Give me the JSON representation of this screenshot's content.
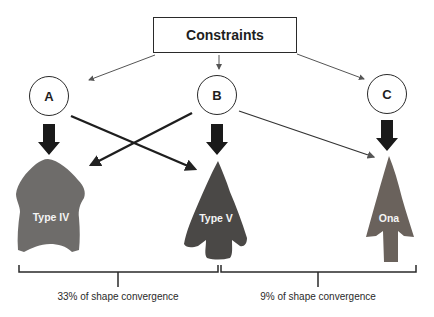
{
  "title": "Constraints",
  "nodes": [
    {
      "id": "A",
      "label": "A"
    },
    {
      "id": "B",
      "label": "B"
    },
    {
      "id": "C",
      "label": "C"
    }
  ],
  "points": [
    {
      "label": "Type IV",
      "color": "#6e6c6a"
    },
    {
      "label": "Type V",
      "color": "#4a4846"
    },
    {
      "label": "Ona",
      "color": "#6a625c"
    }
  ],
  "captions": [
    {
      "label": "33% of shape convergence"
    },
    {
      "label": "9% of shape convergence"
    }
  ],
  "colors": {
    "line": "#2a2a2a",
    "thin_line": "#555555"
  }
}
